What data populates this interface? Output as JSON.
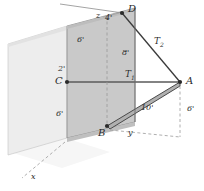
{
  "figure": {
    "colors": {
      "panel_main": "#c9c9c9",
      "panel_side": "#ededed",
      "panel_floor": "#f1f1f1",
      "line": "#3a3a3a",
      "dashed": "#9a9a9a",
      "text": "#2b2b2b",
      "cable_fill": "#b0b0b0"
    }
  },
  "points": [
    {
      "id": "A",
      "label": "A",
      "x": 180,
      "y": 82,
      "dot": true
    },
    {
      "id": "B",
      "label": "B",
      "x": 107,
      "y": 126,
      "dot": true
    },
    {
      "id": "C",
      "label": "C",
      "x": 67,
      "y": 82,
      "dot": true
    },
    {
      "id": "D",
      "label": "D",
      "x": 122,
      "y": 13,
      "dot": true
    }
  ],
  "point_labels": [
    {
      "name": "point-label-d",
      "text": "D",
      "left": 128,
      "top": 6
    },
    {
      "name": "point-label-a",
      "text": "A",
      "left": 186,
      "top": 77
    },
    {
      "name": "point-label-c",
      "text": "C",
      "left": 55,
      "top": 77
    },
    {
      "name": "point-label-b",
      "text": "B",
      "left": 99,
      "top": 128
    }
  ],
  "dimensions": [
    {
      "name": "dim-4ft-top",
      "text": "4'",
      "left": 105,
      "top": 15
    },
    {
      "name": "dim-6ft-upper-left",
      "text": "6'",
      "left": 76,
      "top": 37
    },
    {
      "name": "dim-2ft-left",
      "text": "2'",
      "left": 58,
      "top": 66
    },
    {
      "name": "dim-6ft-lower-left",
      "text": "6'",
      "left": 56,
      "top": 111
    },
    {
      "name": "dim-8ft-middle",
      "text": "8'",
      "left": 121,
      "top": 50
    },
    {
      "name": "dim-10ft-cable",
      "text": "10'",
      "left": 141,
      "top": 105
    },
    {
      "name": "dim-6ft-right",
      "text": "6'",
      "left": 187,
      "top": 106
    }
  ],
  "forces": [
    {
      "name": "force-label-t1",
      "base": "T",
      "sub": "1",
      "left": 126,
      "top": 71
    },
    {
      "name": "force-label-t2",
      "base": "T",
      "sub": "2",
      "left": 155,
      "top": 38
    }
  ],
  "axes": [
    {
      "name": "axis-label-x",
      "text": "x",
      "left": 31,
      "top": 174
    },
    {
      "name": "axis-label-y",
      "text": "y",
      "left": 128,
      "top": 130
    },
    {
      "name": "axis-label-z",
      "text": "z",
      "left": 96,
      "top": 13
    }
  ]
}
